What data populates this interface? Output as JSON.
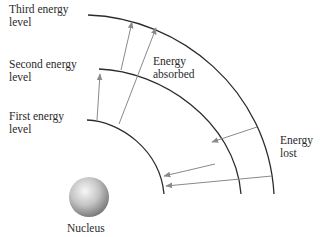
{
  "labels": {
    "third_level": [
      "Third energy",
      "level"
    ],
    "second_level": [
      "Second energy",
      "level"
    ],
    "first_level": [
      "First energy",
      "level"
    ],
    "energy_absorbed": [
      "Energy",
      "absorbed"
    ],
    "energy_lost": [
      "Energy",
      "lost"
    ],
    "nucleus": "Nucleus"
  },
  "colors": {
    "arc": "#2b2b2b",
    "arrow": "#8a8a8a",
    "text": "#2a2a2a",
    "nucleus_light": "#f2f2f2",
    "nucleus_dark": "#8c8c8c"
  }
}
